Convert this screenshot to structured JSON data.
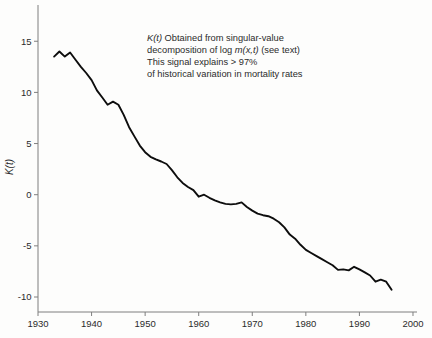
{
  "figure": {
    "background": "#fdfdfc"
  },
  "chart_data": {
    "type": "line",
    "title": "",
    "xlabel": "",
    "ylabel": "K(t)",
    "grid": false,
    "legend": "none",
    "line_color": "#0d0d0d",
    "axis_color": "#7f7f7f",
    "text_color": "#2b2b2b",
    "xlim": [
      1930,
      2001
    ],
    "ylim": [
      -11.5,
      18.5
    ],
    "x_ticks": [
      1930,
      1940,
      1950,
      1960,
      1970,
      1980,
      1990,
      2000
    ],
    "y_ticks": [
      15,
      10,
      5,
      0,
      -5,
      -10
    ],
    "annotation_lines": [
      [
        {
          "text": "K(t)",
          "italic": true
        },
        {
          "text": " Obtained from singular-value",
          "italic": false
        }
      ],
      [
        {
          "text": "decomposition of log ",
          "italic": false
        },
        {
          "text": "m(x,t)",
          "italic": true
        },
        {
          "text": " (see text)",
          "italic": false
        }
      ],
      [
        {
          "text": "This signal explains > 97%",
          "italic": false
        }
      ],
      [
        {
          "text": "of historical variation in mortality rates",
          "italic": false
        }
      ]
    ],
    "series": [
      {
        "name": "K(t)",
        "x": [
          1933,
          1934,
          1935,
          1936,
          1937,
          1938,
          1939,
          1940,
          1941,
          1942,
          1943,
          1944,
          1945,
          1946,
          1947,
          1948,
          1949,
          1950,
          1951,
          1952,
          1953,
          1954,
          1955,
          1956,
          1957,
          1958,
          1959,
          1960,
          1961,
          1962,
          1963,
          1964,
          1965,
          1966,
          1967,
          1968,
          1969,
          1970,
          1971,
          1972,
          1973,
          1974,
          1975,
          1976,
          1977,
          1978,
          1979,
          1980,
          1981,
          1982,
          1983,
          1984,
          1985,
          1986,
          1987,
          1988,
          1989,
          1990,
          1991,
          1992,
          1993,
          1994,
          1995,
          1996
        ],
        "values": [
          13.5,
          14.0,
          13.5,
          13.9,
          13.2,
          12.5,
          11.9,
          11.2,
          10.2,
          9.5,
          8.8,
          9.1,
          8.8,
          7.8,
          6.6,
          5.7,
          4.8,
          4.15,
          3.7,
          3.45,
          3.25,
          3.0,
          2.4,
          1.7,
          1.15,
          0.75,
          0.45,
          -0.2,
          0.0,
          -0.3,
          -0.55,
          -0.75,
          -0.9,
          -0.95,
          -0.9,
          -0.75,
          -1.2,
          -1.55,
          -1.85,
          -2.0,
          -2.1,
          -2.35,
          -2.7,
          -3.2,
          -3.9,
          -4.3,
          -4.9,
          -5.4,
          -5.7,
          -6.0,
          -6.3,
          -6.6,
          -6.9,
          -7.35,
          -7.3,
          -7.4,
          -7.05,
          -7.3,
          -7.6,
          -7.9,
          -8.5,
          -8.3,
          -8.5,
          -9.3
        ]
      }
    ]
  }
}
